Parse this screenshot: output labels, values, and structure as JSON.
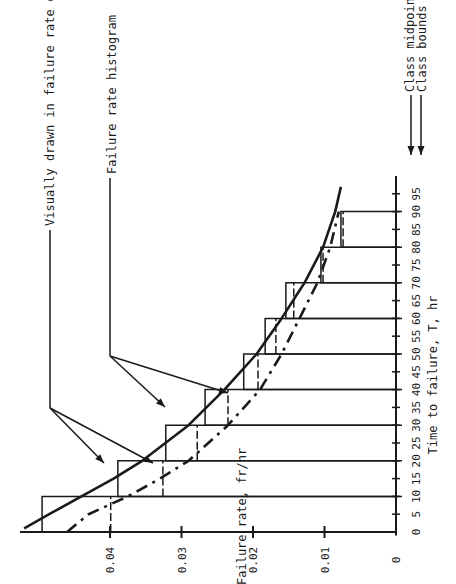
{
  "chart_data": {
    "type": "bar",
    "orientation": "rotated-90-ccw",
    "title": "",
    "xlabel": "Time to failure, T, hr",
    "ylabel": "Failure rate, fr/hr",
    "xlim": [
      0,
      100
    ],
    "ylim": [
      0,
      0.05
    ],
    "x_ticks": [
      0,
      5,
      10,
      15,
      20,
      25,
      30,
      35,
      40,
      45,
      50,
      55,
      60,
      65,
      70,
      75,
      80,
      85,
      90,
      95
    ],
    "x_tick_labels": [
      "0",
      "5",
      "10",
      "15",
      "20",
      "25",
      "30",
      "35",
      "40",
      "45",
      "50",
      "55",
      "60",
      "65",
      "70",
      "75",
      "80",
      "85",
      "90",
      "95"
    ],
    "y_ticks": [
      0,
      0.01,
      0.02,
      0.03,
      0.04
    ],
    "y_tick_labels": [
      "0",
      "0.01",
      "0.02",
      "0.03",
      "0.04"
    ],
    "class_bounds": [
      0,
      10,
      20,
      30,
      40,
      50,
      60,
      70,
      80,
      90
    ],
    "class_midpoints": [
      5,
      15,
      25,
      35,
      45,
      55,
      65,
      75,
      85
    ],
    "series": [
      {
        "name": "Failure rate histogram (class bounds, solid)",
        "style": "solid",
        "bins": [
          [
            0,
            10
          ],
          [
            10,
            20
          ],
          [
            20,
            30
          ],
          [
            30,
            40
          ],
          [
            40,
            50
          ],
          [
            50,
            60
          ],
          [
            60,
            70
          ],
          [
            70,
            80
          ],
          [
            80,
            90
          ]
        ],
        "values": [
          0.0495,
          0.0389,
          0.0322,
          0.0267,
          0.0213,
          0.0183,
          0.0154,
          0.0105,
          0.0077
        ]
      },
      {
        "name": "Failure rate histogram (dashed)",
        "style": "dashed",
        "bins": [
          [
            0,
            10
          ],
          [
            10,
            20
          ],
          [
            20,
            30
          ],
          [
            30,
            40
          ],
          [
            40,
            50
          ],
          [
            50,
            60
          ],
          [
            60,
            70
          ],
          [
            70,
            80
          ],
          [
            80,
            90
          ]
        ],
        "values": [
          0.0399,
          0.0326,
          0.0278,
          0.0235,
          0.0193,
          0.0168,
          0.0143,
          0.0102,
          0.0074
        ]
      },
      {
        "name": "Visually drawn in failure rate curve (solid)",
        "style": "solid-curve",
        "x": [
          1,
          5,
          10,
          15,
          20,
          30,
          40,
          50,
          60,
          70,
          80,
          90,
          97
        ],
        "values": [
          0.052,
          0.0485,
          0.044,
          0.0395,
          0.0355,
          0.029,
          0.024,
          0.0195,
          0.016,
          0.0128,
          0.0102,
          0.0085,
          0.0077
        ]
      },
      {
        "name": "Visually drawn in failure rate curve (dashed)",
        "style": "dashed-curve",
        "x": [
          0,
          5,
          10,
          15,
          20,
          30,
          40,
          50,
          60,
          70,
          80,
          90
        ],
        "values": [
          0.046,
          0.043,
          0.0375,
          0.033,
          0.029,
          0.0235,
          0.019,
          0.016,
          0.0135,
          0.011,
          0.0092,
          0.008
        ]
      }
    ],
    "annotations": [
      "Visually drawn in failure rate curve",
      "Failure rate histogram",
      "Class midpoints",
      "Class bounds"
    ],
    "grid": false,
    "legend": "none (annotations with arrows)"
  },
  "labels": {
    "xlabel": "Time to failure, T, hr",
    "ylabel": "Failure rate, fr/hr",
    "ann_curve": "Visually drawn in failure rate curve",
    "ann_hist": "Failure rate histogram",
    "ann_mid": "Class midpoints",
    "ann_bounds": "Class bounds"
  },
  "colors": {
    "ink": "#1a1a1a",
    "background": "#ffffff"
  }
}
